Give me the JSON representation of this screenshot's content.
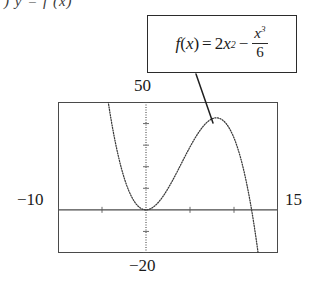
{
  "header": {
    "fragment": ") y = f (x)"
  },
  "callout": {
    "name": "formula-callout",
    "formula_text": "f(x) = 2x^2 - x^3/6",
    "parts": {
      "fname": "f",
      "open": "(",
      "var": "x",
      "close": ")",
      "equals": "=",
      "coef": "2",
      "term1_var": "x",
      "term1_exp": "2",
      "minus": "−",
      "frac_num_var": "x",
      "frac_num_exp": "3",
      "frac_den": "6"
    }
  },
  "graph": {
    "window_labels": {
      "ymax": "50",
      "ymin": "−20",
      "xmin": "−10",
      "xmax": "15"
    },
    "leader_line": {
      "from_x": 196,
      "from_y": 74,
      "to_x": 213,
      "to_y": 123
    }
  },
  "chart_data": {
    "type": "line",
    "title": "",
    "subtitle": "",
    "xlabel": "",
    "ylabel": "",
    "function": "f(x) = 2x^2 - x^3/6",
    "xlim": [
      -10,
      15
    ],
    "ylim": [
      -20,
      50
    ],
    "xtick_step": 5,
    "ytick_step": 10,
    "grid": false,
    "legend": null,
    "axes_style": "calculator-window",
    "line_style": "dotted",
    "annotations": [
      {
        "text": "f(x) = 2x^2 - x^3/6",
        "type": "callout-box",
        "points_to": "local-maximum"
      }
    ],
    "key_points": [
      {
        "label": "local-minimum",
        "x": 0,
        "y": 0
      },
      {
        "label": "local-maximum",
        "x": 8,
        "y": 42.67
      },
      {
        "label": "x-intercept",
        "x": 0,
        "y": 0
      },
      {
        "label": "x-intercept",
        "x": 12,
        "y": 0
      },
      {
        "label": "inflection",
        "x": 4,
        "y": 21.33
      }
    ],
    "x": [
      -10,
      -9.5,
      -9,
      -8.5,
      -8,
      -7.5,
      -7,
      -6.5,
      -6,
      -5.5,
      -5,
      -4.5,
      -4,
      -3.5,
      -3,
      -2.5,
      -2,
      -1.5,
      -1,
      -0.5,
      0,
      0.5,
      1,
      1.5,
      2,
      2.5,
      3,
      3.5,
      4,
      4.5,
      5,
      5.5,
      6,
      6.5,
      7,
      7.5,
      8,
      8.5,
      9,
      9.5,
      10,
      10.5,
      11,
      11.5,
      12,
      12.5,
      13,
      13.5,
      14,
      14.5,
      15
    ],
    "y": [
      366.67,
      323.21,
      283.5,
      247.35,
      214.67,
      185.31,
      159.17,
      136.1,
      116,
      98.73,
      84.17,
      72.19,
      62.67,
      55.48,
      50.5,
      47.6,
      46.67,
      47.56,
      50.17,
      54.35,
      0,
      0.48,
      1.83,
      3.94,
      6.67,
      9.9,
      13.5,
      17.35,
      21.33,
      25.31,
      29.17,
      32.77,
      36,
      38.73,
      40.83,
      42.19,
      42.67,
      42.15,
      40.5,
      37.6,
      33.33,
      27.56,
      20.17,
      11.02,
      0,
      -13.02,
      -28.17,
      -45.56,
      -65.33,
      -87.6,
      -112.5
    ]
  }
}
